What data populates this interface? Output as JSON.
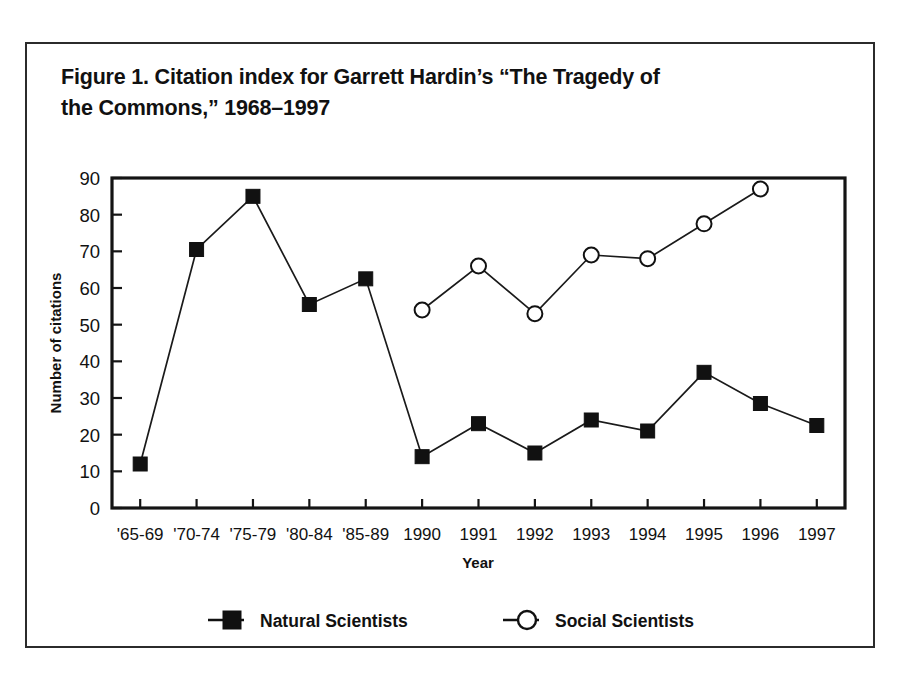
{
  "figure": {
    "title_line1": "Figure 1. Citation index for Garrett Hardin’s “The Tragedy of",
    "title_line2": "the Commons,” 1968–1997"
  },
  "colors": {
    "ink": "#111111",
    "frame": "#2b2b2b",
    "background": "#ffffff",
    "natural_marker": "#111111",
    "social_marker": "#ffffff"
  },
  "legend": {
    "position": "bottom",
    "entries": [
      {
        "label": "Natural Scientists",
        "marker": "filled-square"
      },
      {
        "label": "Social Scientists",
        "marker": "open-circle"
      }
    ]
  },
  "chart_data": {
    "type": "line",
    "title": "Figure 1. Citation index for Garrett Hardin’s “The Tragedy of the Commons,” 1968–1997",
    "xlabel": "Year",
    "ylabel": "Number of citations",
    "ylim": [
      0,
      90
    ],
    "yticks": [
      0,
      10,
      20,
      30,
      40,
      50,
      60,
      70,
      80,
      90
    ],
    "grid": false,
    "categories": [
      "'65-69",
      "'70-74",
      "'75-79",
      "'80-84",
      "'85-89",
      "1990",
      "1991",
      "1992",
      "1993",
      "1994",
      "1995",
      "1996",
      "1997"
    ],
    "series": [
      {
        "name": "Natural Scientists",
        "marker": "filled-square",
        "values": [
          12,
          70.5,
          85,
          55.5,
          62.5,
          14,
          23,
          15,
          24,
          21,
          37,
          28.5,
          22.5
        ]
      },
      {
        "name": "Social Scientists",
        "marker": "open-circle",
        "values": [
          null,
          null,
          null,
          null,
          null,
          54,
          66,
          53,
          69,
          68,
          77.5,
          87,
          null
        ]
      }
    ]
  }
}
